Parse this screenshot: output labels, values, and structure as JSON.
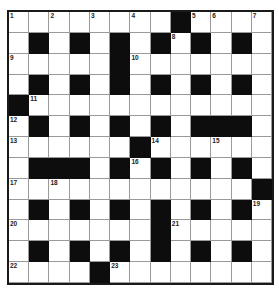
{
  "puzzle": {
    "type": "crossword",
    "rows": 13,
    "cols": 13,
    "layout": [
      "WWWWWWWWBWWWW",
      "WBWBWBWBWBWBW",
      "WWWWWBWWWWWWW",
      "WBWBWBWBWBWBW",
      "BWWWWWWWWWWWW",
      "WBWBWBWBWBBBW",
      "WWWWWWBWWWWWW",
      "WBBBWBWBWBWBW",
      "WWWWWWWWWWWWB",
      "WBWBWBWBWBWBW",
      "WWWWWWWBWWWWW",
      "WBWBWBWBWBWBW",
      "WWWWBWWWWWWWW"
    ],
    "numbers": [
      {
        "row": 0,
        "col": 0,
        "n": "1"
      },
      {
        "row": 0,
        "col": 2,
        "n": "2"
      },
      {
        "row": 0,
        "col": 4,
        "n": "3"
      },
      {
        "row": 0,
        "col": 6,
        "n": "4"
      },
      {
        "row": 0,
        "col": 9,
        "n": "5"
      },
      {
        "row": 0,
        "col": 10,
        "n": "6"
      },
      {
        "row": 0,
        "col": 12,
        "n": "7"
      },
      {
        "row": 1,
        "col": 8,
        "n": "8"
      },
      {
        "row": 2,
        "col": 0,
        "n": "9"
      },
      {
        "row": 2,
        "col": 6,
        "n": "10"
      },
      {
        "row": 4,
        "col": 1,
        "n": "11"
      },
      {
        "row": 5,
        "col": 0,
        "n": "12"
      },
      {
        "row": 6,
        "col": 0,
        "n": "13"
      },
      {
        "row": 6,
        "col": 7,
        "n": "14"
      },
      {
        "row": 6,
        "col": 10,
        "n": "15"
      },
      {
        "row": 7,
        "col": 6,
        "n": "16"
      },
      {
        "row": 8,
        "col": 0,
        "n": "17"
      },
      {
        "row": 8,
        "col": 2,
        "n": "18"
      },
      {
        "row": 9,
        "col": 12,
        "n": "19"
      },
      {
        "row": 10,
        "col": 0,
        "n": "20"
      },
      {
        "row": 10,
        "col": 8,
        "n": "21"
      },
      {
        "row": 12,
        "col": 0,
        "n": "22"
      },
      {
        "row": 12,
        "col": 5,
        "n": "23"
      }
    ],
    "letters": [],
    "colors": {
      "block": "#0d0d0d",
      "cell": "#ffffff",
      "gridline": "#9a9a9a",
      "border": "#1a1a1a"
    }
  }
}
